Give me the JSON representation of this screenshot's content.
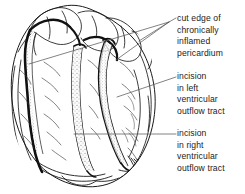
{
  "figure": {
    "kind": "anatomical-line-drawing",
    "ink_color": "#1a1a1a",
    "shading_color": "#8a8a8a",
    "background_color": "#ffffff",
    "leader_color": "#5a5a5a"
  },
  "annotations": [
    {
      "id": "pericardium",
      "name": "cut-edge-of-chronically-inflamed-pericardium",
      "lines": [
        "cut edge of",
        "chronically",
        "inflamed",
        "pericardium"
      ]
    },
    {
      "id": "left-vot",
      "name": "incision-in-left-ventricular-outflow-tract",
      "lines": [
        "incision",
        "in left",
        "ventricular",
        "outflow tract"
      ]
    },
    {
      "id": "right-vot",
      "name": "incision-in-right-ventricular-outflow-tract",
      "lines": [
        "incision",
        "in right",
        "ventricular",
        "outflow tract"
      ]
    }
  ]
}
